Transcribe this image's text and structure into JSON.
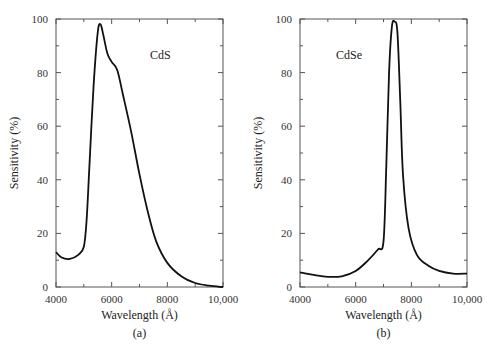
{
  "chart_data": [
    {
      "type": "line",
      "panel_label": "(a)",
      "annotation": "CdS",
      "title": "",
      "xlabel": "Wavelength (Å)",
      "ylabel": "Sensitivity (%)",
      "xlim": [
        4000,
        10000
      ],
      "ylim": [
        0,
        100
      ],
      "x_ticks": [
        "4000",
        "6000",
        "8000",
        "10,000"
      ],
      "y_ticks": [
        "0",
        "20",
        "40",
        "60",
        "80",
        "100"
      ],
      "grid": false,
      "series": [
        {
          "name": "CdS",
          "x": [
            4000,
            4200,
            4500,
            4800,
            5000,
            5100,
            5200,
            5350,
            5500,
            5600,
            5700,
            5850,
            6000,
            6200,
            6400,
            6700,
            7000,
            7300,
            7600,
            8000,
            8500,
            9000,
            9500,
            10000
          ],
          "y": [
            13,
            11,
            10.5,
            12,
            15,
            25,
            45,
            75,
            95,
            98,
            94,
            87,
            84,
            81,
            72,
            58,
            42,
            28,
            17,
            9,
            4,
            1.5,
            0.5,
            0
          ]
        }
      ]
    },
    {
      "type": "line",
      "panel_label": "(b)",
      "annotation": "CdSe",
      "title": "",
      "xlabel": "Wavelength (Å)",
      "ylabel": "Sensitivity (%)",
      "xlim": [
        4000,
        10000
      ],
      "ylim": [
        0,
        100
      ],
      "x_ticks": [
        "4000",
        "6000",
        "8000",
        "10,000"
      ],
      "y_ticks": [
        "0",
        "20",
        "40",
        "60",
        "80",
        "100"
      ],
      "grid": false,
      "series": [
        {
          "name": "CdSe",
          "x": [
            4000,
            4500,
            5000,
            5500,
            6000,
            6400,
            6800,
            7000,
            7100,
            7200,
            7300,
            7400,
            7500,
            7600,
            7700,
            7900,
            8200,
            8600,
            9000,
            9500,
            10000
          ],
          "y": [
            5.5,
            4.5,
            3.8,
            4,
            6,
            9.5,
            14,
            17,
            45,
            80,
            97,
            99,
            95,
            70,
            42,
            22,
            12,
            8,
            6,
            5,
            5
          ]
        }
      ]
    }
  ]
}
